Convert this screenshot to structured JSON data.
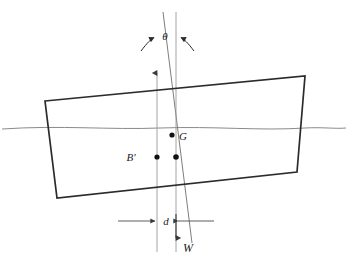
{
  "figure": {
    "background_color": "#ffffff",
    "width": 348,
    "height": 260
  },
  "labels": {
    "heel_angle": "θ",
    "center_of_gravity": "G",
    "center_of_buoyancy_shifted": "B′",
    "righting_arm": "d",
    "weight": "W"
  },
  "colors": {
    "hull_stroke": "#2b2b2b",
    "waterline_stroke": "#8a8a8a",
    "axis_stroke": "#9a9a9a",
    "tilt_axis_stroke": "#6e6e6e",
    "dimension_stroke": "#4a4a4a",
    "point_fill": "#111111",
    "text_fill": "#1a1a1a"
  },
  "elements": {
    "hull": {
      "name": "inclined-rectangular-hull",
      "points": "45,101 305,76 297,172 57,198",
      "tilt_degrees": 5.5
    },
    "waterline": {
      "name": "waterline",
      "path": "M 2,129 C 60,125 110,130 160,128 C 215,126 260,131 305,128 C 322,127 336,129 346,128"
    },
    "vertical_axis": {
      "name": "vertical-reference-axis",
      "x": 157,
      "y_top": 75,
      "y_bottom": 252,
      "arrow_direction": "up"
    },
    "tilt_axis": {
      "name": "body-centerline-axis",
      "x_top": 163,
      "y_top": 12,
      "x_bottom": 192,
      "y_bottom": 243
    },
    "buoyancy_axis": {
      "name": "buoyancy-vertical-axis",
      "x": 176,
      "y_top": 12,
      "y_bottom": 252
    },
    "points": [
      {
        "name": "point-G",
        "x": 172,
        "y": 135,
        "label": "G",
        "label_dx": 6,
        "label_dy": 4
      },
      {
        "name": "point-B-prime",
        "x": 157,
        "y": 157,
        "label": "B′",
        "label_dx": -22,
        "label_dy": 4
      },
      {
        "name": "point-buoyancy-lower",
        "x": 176,
        "y": 157,
        "label": "",
        "label_dx": 0,
        "label_dy": 0
      }
    ],
    "dimension_d": {
      "name": "righting-arm-dimension",
      "y": 221,
      "x_left_start": 118,
      "x_left_arrow": 157,
      "x_right_arrow": 176,
      "x_right_end": 214,
      "label": "d"
    },
    "weight_vector": {
      "name": "weight-force-arrow",
      "x": 176,
      "y_start": 215,
      "y_end": 240,
      "label": "W"
    },
    "theta_arc": {
      "name": "heel-angle-indicator",
      "label": "θ",
      "label_x": 167,
      "label_y": 39,
      "left_arc": "M 143,49 C 149,42 152,39 155,37",
      "right_arc": "M 190,49 C 185,42 182,39 180,37"
    }
  }
}
